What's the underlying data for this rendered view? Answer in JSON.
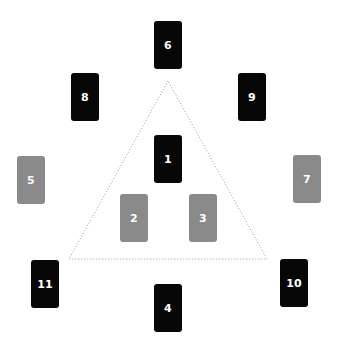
{
  "diagram": {
    "type": "card-spread-layout",
    "colors": {
      "background": "#ffffff",
      "dark_card": "#070707",
      "gray_card": "#8a8a8a",
      "card_text": "#ffffff",
      "triangle_line": "#9a9a9a"
    },
    "triangle": {
      "style": "dotted",
      "apex": [
        168,
        81
      ],
      "bottom_left": [
        69,
        259
      ],
      "bottom_right": [
        267,
        259
      ]
    },
    "cards": [
      {
        "label": "1",
        "tone": "dark",
        "x": 154,
        "y": 135
      },
      {
        "label": "2",
        "tone": "gray",
        "x": 120,
        "y": 194
      },
      {
        "label": "3",
        "tone": "gray",
        "x": 189,
        "y": 194
      },
      {
        "label": "4",
        "tone": "dark",
        "x": 154,
        "y": 284
      },
      {
        "label": "5",
        "tone": "gray",
        "x": 17,
        "y": 156
      },
      {
        "label": "6",
        "tone": "dark",
        "x": 154,
        "y": 21
      },
      {
        "label": "7",
        "tone": "gray",
        "x": 293,
        "y": 155
      },
      {
        "label": "8",
        "tone": "dark",
        "x": 71,
        "y": 73
      },
      {
        "label": "9",
        "tone": "dark",
        "x": 238,
        "y": 73
      },
      {
        "label": "10",
        "tone": "dark",
        "x": 280,
        "y": 259
      },
      {
        "label": "11",
        "tone": "dark",
        "x": 31,
        "y": 260
      }
    ]
  }
}
